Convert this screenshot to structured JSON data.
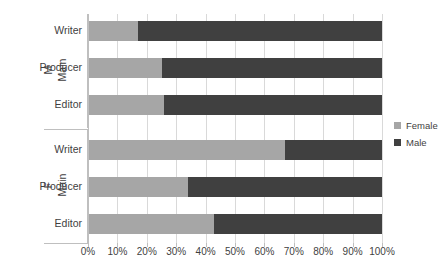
{
  "chart_data": {
    "type": "bar",
    "subtype": "stacked-horizontal-100percent",
    "title": "",
    "xlabel": "",
    "ylabel": "",
    "xlim": [
      0,
      100
    ],
    "xticks": [
      "0%",
      "10%",
      "20%",
      "30%",
      "40%",
      "50%",
      "60%",
      "70%",
      "80%",
      "90%",
      "100%"
    ],
    "xtick_values": [
      0,
      10,
      20,
      30,
      40,
      50,
      60,
      70,
      80,
      90,
      100
    ],
    "grid": true,
    "legend_position": "right",
    "groups": [
      {
        "group_label": "M",
        "group_sublabel": "Main",
        "categories": [
          "Writer",
          "Producer",
          "Editor"
        ],
        "rows": [
          {
            "category": "Writer",
            "Female": 17,
            "Male": 83
          },
          {
            "category": "Producer",
            "Female": 25,
            "Male": 75
          },
          {
            "category": "Editor",
            "Female": 26,
            "Male": 74
          }
        ]
      },
      {
        "group_label": "F",
        "group_sublabel": "Main",
        "categories": [
          "Writer",
          "Producer",
          "Editor"
        ],
        "rows": [
          {
            "category": "Writer",
            "Female": 67,
            "Male": 33
          },
          {
            "category": "Producer",
            "Female": 34,
            "Male": 66
          },
          {
            "category": "Editor",
            "Female": 43,
            "Male": 57
          }
        ]
      }
    ],
    "series": [
      {
        "name": "Female",
        "color": "#a6a6a6"
      },
      {
        "name": "Male",
        "color": "#404040"
      }
    ]
  },
  "legend": {
    "items": [
      {
        "label": "Female",
        "color": "#a6a6a6"
      },
      {
        "label": "Male",
        "color": "#404040"
      }
    ]
  },
  "colors": {
    "female": "#a6a6a6",
    "male": "#404040",
    "grid": "#d9d9d9",
    "axis": "#bfbfbf",
    "text": "#3f3f3f",
    "background": "#ffffff"
  }
}
